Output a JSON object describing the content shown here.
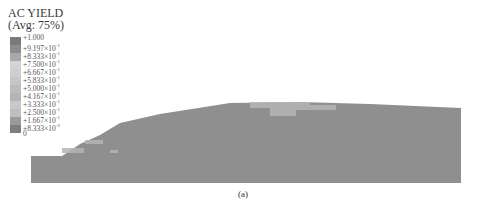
{
  "figure": {
    "caption": "(a)",
    "legend": {
      "title": "AC YIELD",
      "subtitle": "(Avg: 75%)",
      "entries": [
        {
          "label": "+1.000",
          "color": "#7a7a7a"
        },
        {
          "label": "+9.197×10",
          "exp": "-1",
          "color": "#8c8c8c"
        },
        {
          "label": "+8.333×10",
          "exp": "-1",
          "color": "#a8a8a8"
        },
        {
          "label": "+7.500×10",
          "exp": "-1",
          "color": "#d4d4d4"
        },
        {
          "label": "+6.667×10",
          "exp": "-1",
          "color": "#cfcfcf"
        },
        {
          "label": "+5.833×10",
          "exp": "-1",
          "color": "#c6c6c6"
        },
        {
          "label": "+5.000×10",
          "exp": "-1",
          "color": "#bcbcbc"
        },
        {
          "label": "+4.167×10",
          "exp": "-1",
          "color": "#b4b4b4"
        },
        {
          "label": "+3.333×10",
          "exp": "-1",
          "color": "#c9c9c9"
        },
        {
          "label": "+2.500×10",
          "exp": "-1",
          "color": "#bfbfbf"
        },
        {
          "label": "+1.667×10",
          "exp": "-1",
          "color": "#9a9a9a"
        },
        {
          "label": "+8.333×10",
          "exp": "-2",
          "color": "#7e7e7e"
        },
        {
          "label": "0",
          "color": "#6a6a6a"
        }
      ]
    },
    "model_color": "#8f8f8f",
    "yield_zone_color": "#b5b5b5"
  }
}
